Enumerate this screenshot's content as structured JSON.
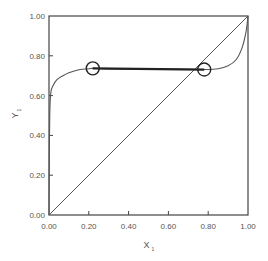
{
  "chart_data": {
    "type": "line",
    "title": "",
    "xlabel": "X",
    "xlabel_subscript": "1",
    "ylabel": "Y",
    "ylabel_subscript": "1",
    "xlim": [
      0,
      1
    ],
    "ylim": [
      0,
      1
    ],
    "grid": false,
    "legend": null,
    "x_ticks": [
      "0.00",
      "0.20",
      "0.40",
      "0.60",
      "0.80",
      "1.00"
    ],
    "y_ticks": [
      "0.00",
      "0.20",
      "0.40",
      "0.60",
      "0.80",
      "1.00"
    ],
    "series": [
      {
        "name": "equilibrium curve",
        "x": [
          0.0,
          0.002,
          0.005,
          0.01,
          0.02,
          0.04,
          0.07,
          0.1,
          0.15,
          0.2,
          0.22,
          0.3,
          0.5,
          0.7,
          0.78,
          0.85,
          0.9,
          0.94,
          0.97,
          0.99,
          1.0
        ],
        "y": [
          0.0,
          0.35,
          0.55,
          0.62,
          0.65,
          0.68,
          0.7,
          0.715,
          0.73,
          0.735,
          0.737,
          0.734,
          0.733,
          0.732,
          0.731,
          0.735,
          0.75,
          0.78,
          0.84,
          0.92,
          1.0
        ]
      },
      {
        "name": "diagonal y=x",
        "x": [
          0,
          1
        ],
        "y": [
          0,
          1
        ]
      },
      {
        "name": "tie line",
        "x": [
          0.22,
          0.78
        ],
        "y": [
          0.737,
          0.731
        ]
      }
    ],
    "annotations": [
      {
        "type": "circle",
        "x": 0.22,
        "y": 0.737,
        "label": ""
      },
      {
        "type": "circle",
        "x": 0.78,
        "y": 0.731,
        "label": ""
      }
    ]
  }
}
